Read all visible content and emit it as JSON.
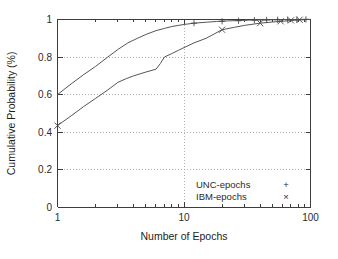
{
  "chart_data": {
    "type": "line",
    "title": "",
    "xlabel": "Number of Epochs",
    "ylabel": "Cumulative Probability (%)",
    "xscale": "log",
    "xlim": [
      1,
      100
    ],
    "ylim": [
      0,
      1
    ],
    "xticks": [
      1,
      10,
      100
    ],
    "xtick_labels": [
      "1",
      "10",
      "100"
    ],
    "yticks": [
      0,
      0.2,
      0.4,
      0.6,
      0.8,
      1
    ],
    "ytick_labels": [
      "0",
      "0.2",
      "0.4",
      "0.6",
      "0.8",
      "1"
    ],
    "grid": true,
    "legend_position": "bottom-right",
    "series": [
      {
        "name": "UNC-epochs",
        "marker": "+",
        "points": [
          [
            1,
            0.6
          ],
          [
            1.3,
            0.66
          ],
          [
            1.6,
            0.705
          ],
          [
            2,
            0.75
          ],
          [
            2.5,
            0.8
          ],
          [
            3,
            0.84
          ],
          [
            3.6,
            0.875
          ],
          [
            4.3,
            0.9
          ],
          [
            5,
            0.92
          ],
          [
            6,
            0.94
          ],
          [
            7,
            0.952
          ],
          [
            8,
            0.962
          ],
          [
            9,
            0.968
          ],
          [
            10,
            0.973
          ],
          [
            12,
            0.98
          ],
          [
            15,
            0.985
          ],
          [
            18,
            0.989
          ],
          [
            22,
            0.992
          ],
          [
            27,
            0.994
          ],
          [
            33,
            0.996
          ],
          [
            40,
            0.997
          ],
          [
            50,
            0.998
          ],
          [
            60,
            0.999
          ],
          [
            70,
            0.999
          ],
          [
            85,
            1.0
          ],
          [
            100,
            1.0
          ]
        ],
        "marker_points": [
          [
            12,
            0.98
          ],
          [
            20,
            0.99
          ],
          [
            27,
            0.993
          ],
          [
            36,
            0.996
          ],
          [
            45,
            0.997
          ],
          [
            55,
            0.998
          ],
          [
            66,
            0.999
          ],
          [
            78,
            0.999
          ],
          [
            92,
            1.0
          ]
        ]
      },
      {
        "name": "IBM-epochs",
        "marker": "x",
        "points": [
          [
            1,
            0.435
          ],
          [
            1.3,
            0.49
          ],
          [
            1.6,
            0.535
          ],
          [
            2,
            0.58
          ],
          [
            2.5,
            0.625
          ],
          [
            3,
            0.665
          ],
          [
            3.5,
            0.685
          ],
          [
            4,
            0.7
          ],
          [
            5,
            0.72
          ],
          [
            6,
            0.735
          ],
          [
            6.5,
            0.765
          ],
          [
            7,
            0.8
          ],
          [
            8,
            0.818
          ],
          [
            9,
            0.835
          ],
          [
            10,
            0.85
          ],
          [
            12,
            0.875
          ],
          [
            15,
            0.9
          ],
          [
            20,
            0.945
          ],
          [
            25,
            0.958
          ],
          [
            30,
            0.968
          ],
          [
            40,
            0.98
          ],
          [
            50,
            0.986
          ],
          [
            60,
            0.99
          ],
          [
            75,
            0.995
          ],
          [
            88,
            0.998
          ],
          [
            100,
            1.0
          ]
        ],
        "marker_points": [
          [
            1,
            0.435
          ],
          [
            20,
            0.945
          ],
          [
            40,
            0.98
          ],
          [
            58,
            0.99
          ],
          [
            70,
            0.995
          ],
          [
            82,
            0.998
          ]
        ]
      }
    ]
  },
  "legend": {
    "entries": [
      {
        "label": "UNC-epochs",
        "marker": "+"
      },
      {
        "label": "IBM-epochs",
        "marker": "×"
      }
    ]
  }
}
